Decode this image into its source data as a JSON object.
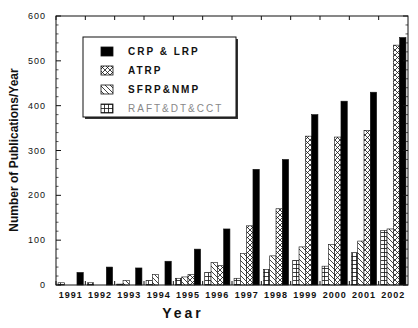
{
  "chart_data": {
    "type": "bar",
    "title": "",
    "xlabel": "Year",
    "ylabel": "Number of Publications/Year",
    "ylim": [
      0,
      600
    ],
    "yticks": [
      0,
      100,
      200,
      300,
      400,
      500,
      600
    ],
    "grid": false,
    "legend_position": "upper-left (inside plot)",
    "categories": [
      "1991",
      "1992",
      "1993",
      "1994",
      "1995",
      "1996",
      "1997",
      "1998",
      "1999",
      "2000",
      "2001",
      "2002"
    ],
    "series": [
      {
        "name": "RAFT&DT&CCT",
        "pattern": "grid",
        "values": [
          5,
          5,
          2,
          10,
          15,
          28,
          15,
          35,
          55,
          42,
          72,
          122
        ]
      },
      {
        "name": "SFRP&NMP",
        "pattern": "diagonal",
        "values": [
          0,
          0,
          10,
          23,
          18,
          50,
          70,
          65,
          85,
          90,
          98,
          125
        ]
      },
      {
        "name": "ATRP",
        "pattern": "crosshatch",
        "values": [
          0,
          0,
          0,
          0,
          23,
          43,
          132,
          170,
          332,
          330,
          345,
          535
        ]
      },
      {
        "name": "CRP & LRP",
        "pattern": "solid",
        "values": [
          28,
          40,
          38,
          53,
          80,
          125,
          258,
          280,
          380,
          410,
          430,
          552
        ]
      }
    ]
  },
  "legend": {
    "items": [
      {
        "label": "CRP & LRP",
        "pattern": "solid"
      },
      {
        "label": "ATRP",
        "pattern": "crosshatch"
      },
      {
        "label": "SFRP&NMP",
        "pattern": "diagonal"
      },
      {
        "label": "RAFT&DT&CCT",
        "pattern": "grid"
      }
    ]
  },
  "axes": {
    "x_label": "Year",
    "y_label": "Number of Publications/Year"
  }
}
